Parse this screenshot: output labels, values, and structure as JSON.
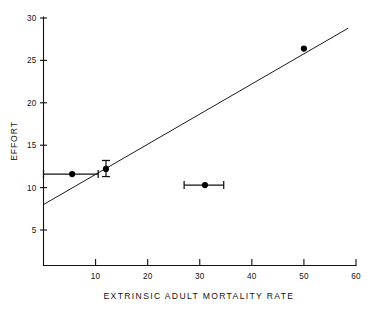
{
  "chart_data": {
    "type": "scatter",
    "title": "",
    "xlabel": "EXTRINSIC ADULT MORTALITY RATE",
    "ylabel": "EFFORT",
    "xlim": [
      0,
      60
    ],
    "ylim": [
      2.5,
      30
    ],
    "grid": false,
    "legend": "none",
    "xticks": [
      10,
      20,
      30,
      40,
      50,
      60
    ],
    "xtick_labels": [
      "10",
      "20",
      "30",
      "40",
      "50",
      "60"
    ],
    "yticks": [
      5,
      10,
      15,
      20,
      25,
      30
    ],
    "ytick_labels": [
      "5",
      "10",
      "15",
      "20",
      "25",
      "30"
    ],
    "points": [
      {
        "id": "point-1",
        "x": 5.5,
        "y": 11.6,
        "xerr_low": 0.0,
        "xerr_high": 10.5,
        "yerr_low": null,
        "yerr_high": null
      },
      {
        "id": "point-2",
        "x": 12.0,
        "y": 12.2,
        "xerr_low": null,
        "xerr_high": null,
        "yerr_low": 11.3,
        "yerr_high": 13.2
      },
      {
        "id": "point-3",
        "x": 31.0,
        "y": 10.3,
        "xerr_low": 27.0,
        "xerr_high": 34.6,
        "yerr_low": null,
        "yerr_high": null
      },
      {
        "id": "point-4",
        "x": 50.0,
        "y": 26.4,
        "xerr_low": null,
        "xerr_high": null,
        "yerr_low": null,
        "yerr_high": null
      }
    ],
    "series": [
      {
        "name": "data",
        "x": [
          5.5,
          12.0,
          31.0,
          50.0
        ],
        "values": [
          11.6,
          12.2,
          10.3,
          26.4
        ]
      }
    ],
    "fit_line": {
      "type": "line",
      "x_start": 0.0,
      "y_start": 8.0,
      "x_end": 58.5,
      "y_end": 28.8,
      "slope": 0.3556,
      "intercept": 8.0
    },
    "colors": {
      "axis": "#111111",
      "marker": "#000000",
      "line": "#1a1a1a",
      "background": "#ffffff"
    }
  }
}
